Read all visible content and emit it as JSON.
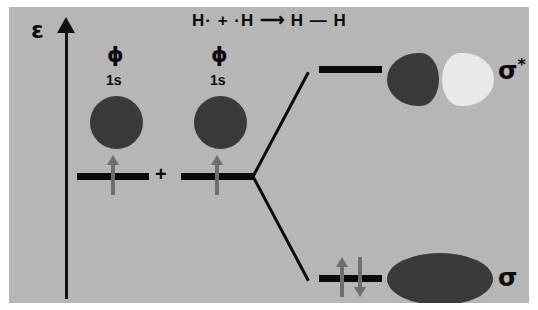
{
  "diagram": {
    "background_color": "#b6b6b6",
    "axis": {
      "label": "ε",
      "name": "energy",
      "direction": "up"
    },
    "equation": "H· + ·H ⟶ H — H",
    "atomic_orbitals": [
      {
        "symbol": "ϕ",
        "shell": "1s",
        "electrons": 1,
        "spin": "up"
      },
      {
        "symbol": "ϕ",
        "shell": "1s",
        "electrons": 1,
        "spin": "up"
      }
    ],
    "operator": "+",
    "molecular_orbitals": [
      {
        "label": "σ",
        "superscript": "*",
        "type": "antibonding",
        "electrons": 0,
        "lobes": 2,
        "node": true
      },
      {
        "label": "σ",
        "superscript": "",
        "type": "bonding",
        "electrons": 2,
        "lobes": 1,
        "node": false
      }
    ],
    "colors": {
      "background": "#b6b6b6",
      "orbital_dark": "#3a3a3a",
      "orbital_light": "#e9e9e9",
      "level_bar": "#0a0a0a",
      "electron_arrow": "#6e6e6e",
      "text": "#0c0c0c"
    }
  },
  "chart_data": {
    "type": "diagram",
    "ylabel": "ε",
    "levels": [
      {
        "name": "σ*",
        "side": "right",
        "relative_energy": 0.92,
        "electrons": 0
      },
      {
        "name": "1s (ϕ) left",
        "side": "left",
        "relative_energy": 0.5,
        "electrons": 1
      },
      {
        "name": "1s (ϕ) right",
        "side": "left",
        "relative_energy": 0.5,
        "electrons": 1
      },
      {
        "name": "σ",
        "side": "right",
        "relative_energy": 0.08,
        "electrons": 2
      }
    ]
  }
}
